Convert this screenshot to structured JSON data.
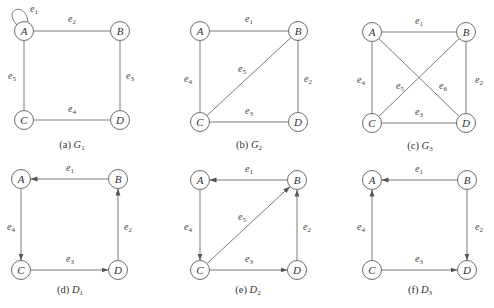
{
  "colors": {
    "stroke": "#7a7a7a",
    "node_stroke": "#6b6b6b",
    "text": "#333333",
    "background": "#ffffff"
  },
  "node_radius": 9.5,
  "graphs": [
    {
      "id": "G1",
      "caption_prefix": "(a)",
      "caption_letter": "G",
      "caption_sub": "1",
      "directed": false,
      "caption_pos": [
        72,
        148
      ],
      "nodes": [
        {
          "id": "A",
          "x": 24,
          "y": 31
        },
        {
          "id": "B",
          "x": 120,
          "y": 31
        },
        {
          "id": "C",
          "x": 24,
          "y": 120
        },
        {
          "id": "D",
          "x": 120,
          "y": 120
        }
      ],
      "edges": [
        {
          "label": "1",
          "from": "A",
          "to": "A",
          "loop": true,
          "lx": 30,
          "ly": 12
        },
        {
          "label": "2",
          "from": "A",
          "to": "B",
          "lx": 68,
          "ly": 22
        },
        {
          "label": "3",
          "from": "B",
          "to": "D",
          "lx": 126,
          "ly": 79
        },
        {
          "label": "4",
          "from": "C",
          "to": "D",
          "lx": 68,
          "ly": 112
        },
        {
          "label": "5",
          "from": "A",
          "to": "C",
          "lx": 8,
          "ly": 79
        }
      ]
    },
    {
      "id": "G2",
      "caption_prefix": "(b)",
      "caption_letter": "G",
      "caption_sub": "2",
      "directed": false,
      "caption_pos": [
        249,
        148
      ],
      "nodes": [
        {
          "id": "A",
          "x": 200,
          "y": 31
        },
        {
          "id": "B",
          "x": 298,
          "y": 31
        },
        {
          "id": "C",
          "x": 200,
          "y": 122
        },
        {
          "id": "D",
          "x": 298,
          "y": 122
        }
      ],
      "edges": [
        {
          "label": "1",
          "from": "A",
          "to": "B",
          "lx": 245,
          "ly": 22
        },
        {
          "label": "2",
          "from": "B",
          "to": "D",
          "lx": 304,
          "ly": 82
        },
        {
          "label": "3",
          "from": "C",
          "to": "D",
          "lx": 245,
          "ly": 114
        },
        {
          "label": "4",
          "from": "A",
          "to": "C",
          "lx": 184,
          "ly": 82
        },
        {
          "label": "5",
          "from": "C",
          "to": "B",
          "lx": 238,
          "ly": 72
        }
      ]
    },
    {
      "id": "G3",
      "caption_prefix": "(c)",
      "caption_letter": "G",
      "caption_sub": "3",
      "directed": false,
      "caption_pos": [
        420,
        149
      ],
      "nodes": [
        {
          "id": "A",
          "x": 372,
          "y": 32
        },
        {
          "id": "B",
          "x": 466,
          "y": 32
        },
        {
          "id": "C",
          "x": 372,
          "y": 123
        },
        {
          "id": "D",
          "x": 466,
          "y": 123
        }
      ],
      "edges": [
        {
          "label": "1",
          "from": "A",
          "to": "B",
          "lx": 415,
          "ly": 24
        },
        {
          "label": "2",
          "from": "B",
          "to": "D",
          "lx": 475,
          "ly": 83
        },
        {
          "label": "3",
          "from": "C",
          "to": "D",
          "lx": 415,
          "ly": 115
        },
        {
          "label": "4",
          "from": "A",
          "to": "C",
          "lx": 357,
          "ly": 83
        },
        {
          "label": "5",
          "from": "C",
          "to": "B",
          "lx": 396,
          "ly": 89
        },
        {
          "label": "6",
          "from": "A",
          "to": "D",
          "lx": 439,
          "ly": 89
        }
      ]
    },
    {
      "id": "D1",
      "caption_prefix": "(d)",
      "caption_letter": "D",
      "caption_sub": "1",
      "directed": true,
      "caption_pos": [
        70,
        293
      ],
      "nodes": [
        {
          "id": "A",
          "x": 21,
          "y": 179
        },
        {
          "id": "B",
          "x": 118,
          "y": 179
        },
        {
          "id": "C",
          "x": 21,
          "y": 270
        },
        {
          "id": "D",
          "x": 118,
          "y": 270
        }
      ],
      "edges": [
        {
          "label": "1",
          "from": "B",
          "to": "A",
          "lx": 66,
          "ly": 171
        },
        {
          "label": "2",
          "from": "D",
          "to": "B",
          "lx": 124,
          "ly": 230
        },
        {
          "label": "3",
          "from": "C",
          "to": "D",
          "lx": 66,
          "ly": 262
        },
        {
          "label": "4",
          "from": "A",
          "to": "C",
          "lx": 7,
          "ly": 230
        }
      ]
    },
    {
      "id": "D2",
      "caption_prefix": "(e)",
      "caption_letter": "D",
      "caption_sub": "2",
      "directed": true,
      "caption_pos": [
        248,
        293
      ],
      "nodes": [
        {
          "id": "A",
          "x": 200,
          "y": 180
        },
        {
          "id": "B",
          "x": 297,
          "y": 180
        },
        {
          "id": "C",
          "x": 200,
          "y": 270
        },
        {
          "id": "D",
          "x": 297,
          "y": 270
        }
      ],
      "edges": [
        {
          "label": "1",
          "from": "B",
          "to": "A",
          "lx": 245,
          "ly": 172
        },
        {
          "label": "2",
          "from": "D",
          "to": "B",
          "lx": 303,
          "ly": 230
        },
        {
          "label": "3",
          "from": "C",
          "to": "D",
          "lx": 245,
          "ly": 262
        },
        {
          "label": "4",
          "from": "A",
          "to": "C",
          "lx": 184,
          "ly": 230
        },
        {
          "label": "5",
          "from": "C",
          "to": "B",
          "lx": 238,
          "ly": 220
        }
      ]
    },
    {
      "id": "D3",
      "caption_prefix": "(f)",
      "caption_letter": "D",
      "caption_sub": "3",
      "directed": true,
      "caption_pos": [
        420,
        293
      ],
      "nodes": [
        {
          "id": "A",
          "x": 372,
          "y": 180
        },
        {
          "id": "B",
          "x": 467,
          "y": 180
        },
        {
          "id": "C",
          "x": 372,
          "y": 270
        },
        {
          "id": "D",
          "x": 467,
          "y": 270
        }
      ],
      "edges": [
        {
          "label": "1",
          "from": "B",
          "to": "A",
          "lx": 415,
          "ly": 172
        },
        {
          "label": "2",
          "from": "B",
          "to": "D",
          "lx": 475,
          "ly": 230
        },
        {
          "label": "3",
          "from": "C",
          "to": "D",
          "lx": 415,
          "ly": 262
        },
        {
          "label": "4",
          "from": "C",
          "to": "A",
          "lx": 357,
          "ly": 230
        }
      ]
    }
  ]
}
